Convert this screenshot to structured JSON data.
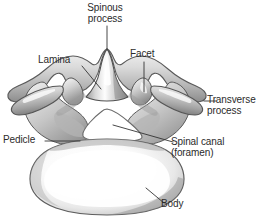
{
  "figure": {
    "view": "superior",
    "background_color": "#ffffff",
    "text_color": "#2b2b2b",
    "leader_line_color": "#333333",
    "bone_fill_light": "#ffffff",
    "bone_fill_mid": "#d5d5d5",
    "bone_fill_shadow": "#8a8a8a",
    "bone_outline": "#555555",
    "foramen_fill": "#ffffff"
  },
  "labels": {
    "spinous_process": {
      "line1": "Spinous",
      "line2": "process"
    },
    "lamina": {
      "line1": "Lamina"
    },
    "facet": {
      "line1": "Facet"
    },
    "transverse_process": {
      "line1": "Transverse",
      "line2": "process"
    },
    "pedicle": {
      "line1": "Pedicle"
    },
    "spinal_canal": {
      "line1": "Spinal canal",
      "line2": "(foramen)"
    },
    "body": {
      "line1": "Body"
    }
  },
  "parts": [
    {
      "name": "spinous-process",
      "label": "Spinous process"
    },
    {
      "name": "lamina",
      "label": "Lamina"
    },
    {
      "name": "facet",
      "label": "Facet"
    },
    {
      "name": "transverse-process",
      "label": "Transverse process"
    },
    {
      "name": "pedicle",
      "label": "Pedicle"
    },
    {
      "name": "spinal-canal",
      "label": "Spinal canal (foramen)"
    },
    {
      "name": "vertebral-body",
      "label": "Body"
    }
  ]
}
